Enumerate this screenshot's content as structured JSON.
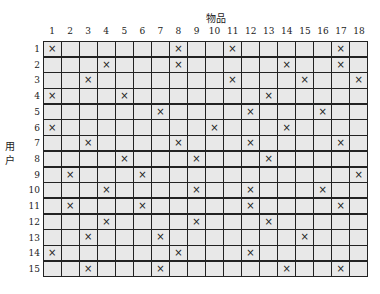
{
  "title": "物品",
  "y_title": "用户",
  "columns": [
    "1",
    "2",
    "3",
    "4",
    "5",
    "6",
    "7",
    "8",
    "9",
    "10",
    "11",
    "12",
    "13",
    "14",
    "15",
    "16",
    "17",
    "18"
  ],
  "rows": [
    "1",
    "2",
    "3",
    "4",
    "5",
    "6",
    "7",
    "8",
    "9",
    "10",
    "11",
    "12",
    "13",
    "14",
    "15"
  ],
  "mark_glyph": "×",
  "colors": {
    "cell": "#e8e8e8",
    "border": "#222222"
  },
  "chart_data": {
    "type": "table",
    "title": "物品",
    "xlabel": "物品",
    "ylabel": "用户",
    "marks": {
      "1": [
        1,
        8,
        11,
        17
      ],
      "2": [
        4,
        8,
        14,
        17
      ],
      "3": [
        3,
        11,
        15,
        18
      ],
      "4": [
        1,
        5,
        13
      ],
      "5": [
        7,
        12,
        16
      ],
      "6": [
        1,
        10,
        14
      ],
      "7": [
        3,
        8,
        12,
        17
      ],
      "8": [
        5,
        9,
        13
      ],
      "9": [
        2,
        6,
        18
      ],
      "10": [
        4,
        9,
        12,
        16
      ],
      "11": [
        2,
        6,
        12,
        17
      ],
      "12": [
        4,
        9,
        13
      ],
      "13": [
        3,
        7,
        15
      ],
      "14": [
        1,
        8,
        12
      ],
      "15": [
        3,
        7,
        14,
        17
      ]
    }
  }
}
